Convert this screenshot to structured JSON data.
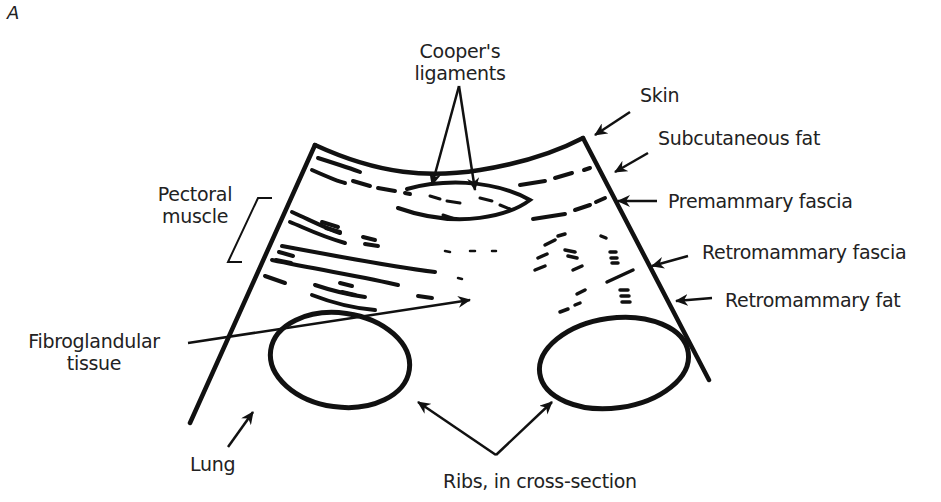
{
  "figure": {
    "panel_label": "A"
  },
  "labels": {
    "coopers_ligaments_line1": "Cooper's",
    "coopers_ligaments_line2": "ligaments",
    "skin": "Skin",
    "subcutaneous_fat": "Subcutaneous fat",
    "premammary_fascia": "Premammary fascia",
    "retromammary_fascia": "Retromammary fascia",
    "retromammary_fat": "Retromammary fat",
    "pectoral_muscle_line1": "Pectoral",
    "pectoral_muscle_line2": "muscle",
    "fibroglandular_line1": "Fibroglandular",
    "fibroglandular_line2": "tissue",
    "lung": "Lung",
    "ribs": "Ribs, in cross-section"
  },
  "colors": {
    "ink": "#111111",
    "text": "#222222",
    "background": "#ffffff"
  }
}
